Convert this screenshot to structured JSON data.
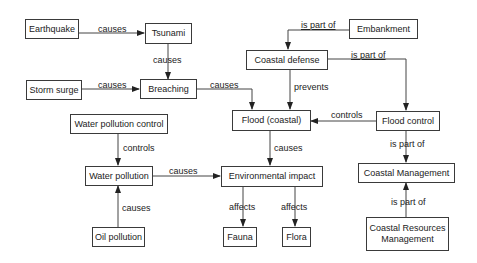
{
  "diagram": {
    "type": "concept-map",
    "nodes": {
      "earthquake": "Earthquake",
      "tsunami": "Tsunami",
      "storm_surge": "Storm surge",
      "breaching": "Breaching",
      "embankment": "Embankment",
      "coastal_defense": "Coastal defense",
      "flood_coastal": "Flood (coastal)",
      "flood_control": "Flood control",
      "water_pollution_control": "Water pollution control",
      "water_pollution": "Water pollution",
      "environmental_impact": "Environmental impact",
      "coastal_management": "Coastal Management",
      "oil_pollution": "Oil pollution",
      "fauna": "Fauna",
      "flora": "Flora",
      "coastal_resources_management": "Coastal Resources Management"
    },
    "edges": [
      {
        "from": "Earthquake",
        "to": "Tsunami",
        "label": "causes"
      },
      {
        "from": "Tsunami",
        "to": "Breaching",
        "label": "causes"
      },
      {
        "from": "Storm surge",
        "to": "Breaching",
        "label": "causes"
      },
      {
        "from": "Breaching",
        "to": "Flood (coastal)",
        "label": "causes"
      },
      {
        "from": "Embankment",
        "to": "Coastal defense",
        "label": "is part of"
      },
      {
        "from": "Coastal defense",
        "to": "Flood control",
        "label": "is part of"
      },
      {
        "from": "Coastal defense",
        "to": "Flood (coastal)",
        "label": "prevents"
      },
      {
        "from": "Flood control",
        "to": "Flood (coastal)",
        "label": "controls"
      },
      {
        "from": "Water pollution control",
        "to": "Water pollution",
        "label": "controls"
      },
      {
        "from": "Water pollution",
        "to": "Environmental impact",
        "label": "causes"
      },
      {
        "from": "Flood (coastal)",
        "to": "Environmental impact",
        "label": "causes"
      },
      {
        "from": "Oil pollution",
        "to": "Water pollution",
        "label": "causes"
      },
      {
        "from": "Environmental impact",
        "to": "Fauna",
        "label": "affects"
      },
      {
        "from": "Environmental impact",
        "to": "Flora",
        "label": "affects"
      },
      {
        "from": "Flood control",
        "to": "Coastal Management",
        "label": "is part of"
      },
      {
        "from": "Coastal Resources Management",
        "to": "Coastal Management",
        "label": "is part of"
      }
    ],
    "edge_labels": {
      "earthquake_tsunami": "causes",
      "tsunami_breaching": "causes",
      "stormsurge_breaching": "causes",
      "breaching_flood": "causes",
      "embankment_defense": "is part of",
      "defense_floodcontrol": "is part of",
      "defense_flood": "prevents",
      "floodcontrol_flood": "controls",
      "wpc_wp": "controls",
      "wp_env": "causes",
      "flood_env": "causes",
      "oil_wp": "causes",
      "env_fauna": "affects",
      "env_flora": "affects",
      "floodcontrol_cm": "is part of",
      "crm_cm": "is part of"
    }
  }
}
